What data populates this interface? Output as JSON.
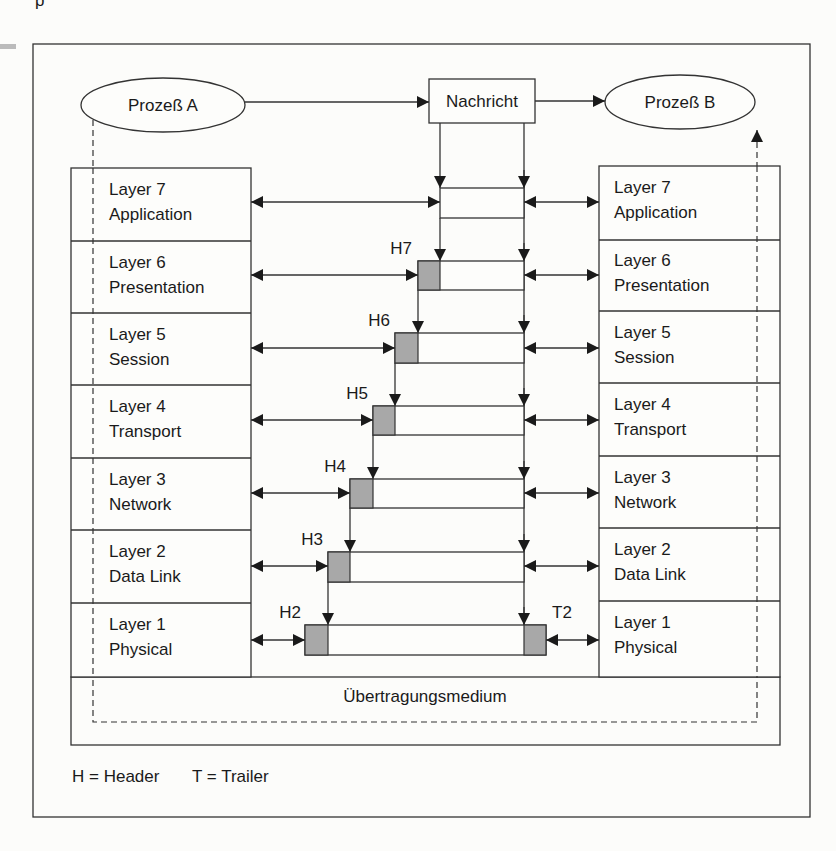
{
  "top_fragment": "p",
  "processes": {
    "a": {
      "label": "Prozeß A"
    },
    "b": {
      "label": "Prozeß B"
    }
  },
  "message": {
    "label": "Nachricht"
  },
  "left_stack": [
    {
      "line1": "Layer 7",
      "line2": "Application"
    },
    {
      "line1": "Layer 6",
      "line2": "Presentation"
    },
    {
      "line1": "Layer 5",
      "line2": "Session"
    },
    {
      "line1": "Layer 4",
      "line2": "Transport"
    },
    {
      "line1": "Layer 3",
      "line2": "Network"
    },
    {
      "line1": "Layer 2",
      "line2": "Data Link"
    },
    {
      "line1": "Layer 1",
      "line2": "Physical"
    }
  ],
  "right_stack": [
    {
      "line1": "Layer 7",
      "line2": "Application"
    },
    {
      "line1": "Layer 6",
      "line2": "Presentation"
    },
    {
      "line1": "Layer 5",
      "line2": "Session"
    },
    {
      "line1": "Layer 4",
      "line2": "Transport"
    },
    {
      "line1": "Layer 3",
      "line2": "Network"
    },
    {
      "line1": "Layer 2",
      "line2": "Data Link"
    },
    {
      "line1": "Layer 1",
      "line2": "Physical"
    }
  ],
  "headers": [
    "H7",
    "H6",
    "H5",
    "H4",
    "H3",
    "H2"
  ],
  "trailer": "T2",
  "medium": {
    "label": "Übertragungsmedium"
  },
  "legend": {
    "header": "H = Header",
    "trailer": "T = Trailer"
  },
  "colors": {
    "line": "#333333",
    "header_fill": "#a8a8a8",
    "background": "#fcfcfa"
  }
}
